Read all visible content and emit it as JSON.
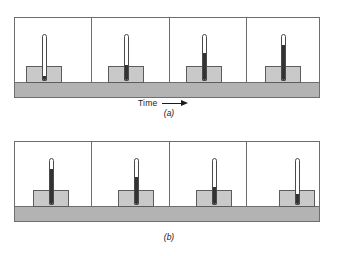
{
  "figure": {
    "caption_a": "(a)",
    "caption_b": "(b)",
    "time_label": "Time",
    "time_arrow_icon": "right-arrow-icon",
    "colors": {
      "ground": "#b3b3b3",
      "block": "#c9c9c9",
      "outline": "#6e6e6e",
      "mercury": "#333333",
      "tube": "#ffffff",
      "text": "#1a1a1a",
      "background": "#ffffff"
    }
  },
  "chart_data": {
    "type": "line",
    "xlabel": "Time",
    "ylabel": "Mercury column height (fraction of tube)",
    "grid": false,
    "legend": "none",
    "categories": [
      "t1",
      "t2",
      "t3",
      "t4"
    ],
    "series": [
      {
        "name": "(a) block warming up",
        "values": [
          0.08,
          0.34,
          0.62,
          0.8
        ]
      },
      {
        "name": "(b) block cooling down",
        "values": [
          0.8,
          0.62,
          0.38,
          0.22
        ]
      }
    ],
    "ylim": [
      0,
      1
    ]
  },
  "panels": {
    "a": [
      {
        "name": "panel-a-1",
        "mercury_fraction": 0.08,
        "thermo_height_px": 47,
        "block_left_px": 11,
        "thermo_left_px": 27
      },
      {
        "name": "panel-a-2",
        "mercury_fraction": 0.34,
        "thermo_height_px": 47,
        "block_left_px": 16,
        "thermo_left_px": 32
      },
      {
        "name": "panel-a-3",
        "mercury_fraction": 0.62,
        "thermo_height_px": 47,
        "block_left_px": 16,
        "thermo_left_px": 32
      },
      {
        "name": "panel-a-4",
        "mercury_fraction": 0.8,
        "thermo_height_px": 47,
        "block_left_px": 18,
        "thermo_left_px": 34
      }
    ],
    "b": [
      {
        "name": "panel-b-1",
        "mercury_fraction": 0.8,
        "thermo_height_px": 47,
        "block_left_px": 18,
        "thermo_left_px": 34
      },
      {
        "name": "panel-b-2",
        "mercury_fraction": 0.62,
        "thermo_height_px": 47,
        "block_left_px": 26,
        "thermo_left_px": 42
      },
      {
        "name": "panel-b-3",
        "mercury_fraction": 0.38,
        "thermo_height_px": 47,
        "block_left_px": 26,
        "thermo_left_px": 42
      },
      {
        "name": "panel-b-4",
        "mercury_fraction": 0.22,
        "thermo_height_px": 47,
        "block_left_px": 32,
        "thermo_left_px": 48
      }
    ]
  }
}
